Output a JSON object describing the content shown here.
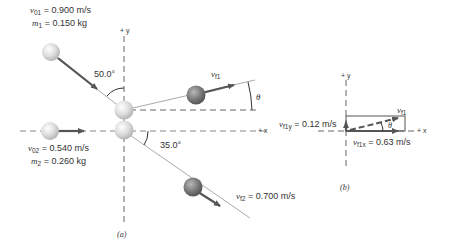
{
  "figure_a": {
    "caption": "(a)",
    "axis_y_label": "+ y",
    "axis_x_label": "+ x",
    "ball1": {
      "v_label": "v",
      "v_sub": "01",
      "v_value": "= 0.900 m/s",
      "m_label": "m",
      "m_sub": "1",
      "m_value": "= 0.150 kg"
    },
    "ball2": {
      "v_label": "v",
      "v_sub": "02",
      "v_value": "= 0.540 m/s",
      "m_label": "m",
      "m_sub": "2",
      "m_value": "= 0.260 kg"
    },
    "angle_incoming": "50.0°",
    "angle_outgoing2": "35.0°",
    "vf1": {
      "label": "v",
      "sub": "f1"
    },
    "theta": "θ",
    "vf2": {
      "label": "v",
      "sub": "f2",
      "value": "= 0.700 m/s"
    }
  },
  "figure_b": {
    "caption": "(b)",
    "axis_y_label": "+ y",
    "axis_x_label": "+ x",
    "vf1": {
      "label": "v",
      "sub": "f1"
    },
    "vf1y": {
      "label": "v",
      "sub": "f1y",
      "value": "= 0.12 m/s"
    },
    "vf1x": {
      "label": "v",
      "sub": "f1x",
      "value": "= 0.63 m/s"
    },
    "theta": "θ"
  },
  "colors": {
    "ball_light": "#e2e2e2",
    "ball_dark": "#7a7a7a",
    "arrow": "#555555",
    "line": "#aaaaaa"
  }
}
